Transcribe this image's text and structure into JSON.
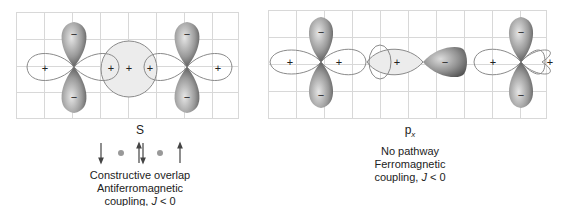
{
  "left": {
    "orbital_label": "s",
    "orbital_label_display": "S",
    "line1": "Constructive overlap",
    "line2": "Antiferromagnetic",
    "line3_prefix": "coupling, ",
    "line3_j": "J",
    "line3_suffix": " < 0",
    "lobes": {
      "top": "−",
      "bottom": "−",
      "side": "+",
      "center": "+"
    },
    "spins": [
      "down",
      "dot",
      "up-down",
      "dot",
      "up"
    ]
  },
  "right": {
    "orbital_label_base": "p",
    "orbital_label_sub": "x",
    "line1": "No pathway",
    "line2": "Ferromagnetic",
    "line3_prefix": "coupling, ",
    "line3_j": "J",
    "line3_suffix": " < 0",
    "lobes": {
      "top": "−",
      "bottom": "−",
      "side": "+",
      "px_pos": "+",
      "px_neg": "−"
    }
  },
  "colors": {
    "grid": "#d8d8d8",
    "outline": "#8a8a8a",
    "lobe_dark": "#5a5a5a",
    "lobe_light": "#d9d9d9",
    "overlap_fill": "#ececec"
  }
}
